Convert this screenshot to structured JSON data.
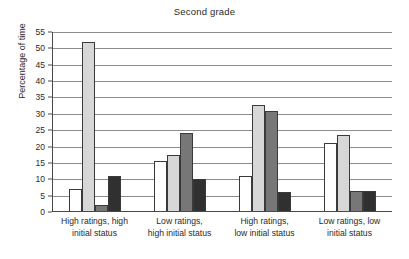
{
  "chart_data": {
    "type": "bar",
    "title": "Second grade",
    "xlabel": "",
    "ylabel": "Percentage of time",
    "ylim": [
      0,
      55
    ],
    "yticks": [
      0,
      5,
      10,
      15,
      20,
      25,
      30,
      35,
      40,
      45,
      50,
      55
    ],
    "grid": true,
    "legend": "none",
    "categories": [
      "High ratings, high initial status",
      "Low ratings, high initial status",
      "High ratings, low initial status",
      "Low ratings, low initial status"
    ],
    "category_lines": [
      [
        "High ratings, high",
        "initial status"
      ],
      [
        "Low ratings,",
        "high initial status"
      ],
      [
        "High ratings,",
        "low initial status"
      ],
      [
        "Low ratings, low",
        "initial status"
      ]
    ],
    "series": [
      {
        "name": "series-1",
        "color": "#ffffff",
        "values": [
          7,
          15.5,
          11,
          21
        ]
      },
      {
        "name": "series-2",
        "color": "#d7d7d7",
        "values": [
          52,
          17.5,
          32.8,
          23.5
        ]
      },
      {
        "name": "series-3",
        "color": "#777777",
        "values": [
          2,
          24,
          31,
          6.5
        ]
      },
      {
        "name": "series-4",
        "color": "#303030",
        "values": [
          11,
          10,
          6,
          6.5
        ]
      }
    ]
  },
  "colors": {
    "axis": "#4a4a4a",
    "gridline": "#8d8d8d",
    "text": "#2a2a2a",
    "bar_outline": "#3a3a3a"
  }
}
